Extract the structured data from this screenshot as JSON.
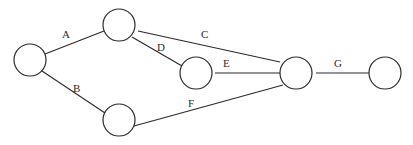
{
  "diagram": {
    "type": "network",
    "nodes": [
      {
        "id": "n1",
        "cx": 30,
        "cy": 60,
        "r": 16
      },
      {
        "id": "n2",
        "cx": 119,
        "cy": 25,
        "r": 16
      },
      {
        "id": "n3",
        "cx": 196,
        "cy": 73,
        "r": 16
      },
      {
        "id": "n4",
        "cx": 119,
        "cy": 120,
        "r": 16
      },
      {
        "id": "n5",
        "cx": 296,
        "cy": 73,
        "r": 16
      },
      {
        "id": "n6",
        "cx": 385,
        "cy": 73,
        "r": 16
      }
    ],
    "edges": [
      {
        "label": "A",
        "from": "n1",
        "to": "n2",
        "label_x": 62,
        "label_y": 38
      },
      {
        "label": "B",
        "from": "n1",
        "to": "n4",
        "label_x": 73,
        "label_y": 92
      },
      {
        "label": "C",
        "from": "n2",
        "to": "n5",
        "label_x": 201,
        "label_y": 38
      },
      {
        "label": "D",
        "from": "n2",
        "to": "n3",
        "label_x": 157,
        "label_y": 51
      },
      {
        "label": "E",
        "from": "n3",
        "to": "n5",
        "label_x": 223,
        "label_y": 67
      },
      {
        "label": "F",
        "from": "n4",
        "to": "n5",
        "label_x": 188,
        "label_y": 107
      },
      {
        "label": "G",
        "from": "n5",
        "to": "n6",
        "label_x": 334,
        "label_y": 67
      }
    ],
    "colors": {
      "stroke": "#2b2b2b",
      "background": "#ffffff"
    }
  }
}
